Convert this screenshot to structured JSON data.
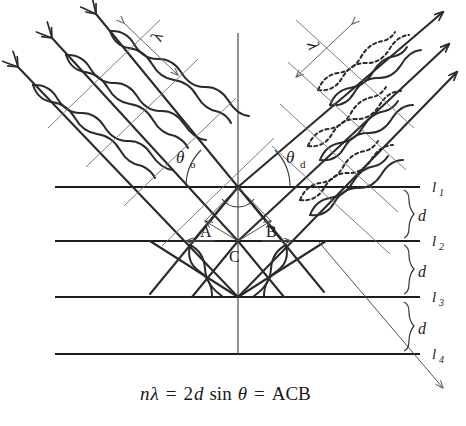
{
  "figure": {
    "equation": {
      "n": "n",
      "lambda": "λ",
      "eq1": "=",
      "two": "2",
      "d": "d",
      "sin": "sin",
      "theta": "θ",
      "eq2": "=",
      "acb": "ACB",
      "full": "nλ = 2d sin θ = ACB"
    },
    "angles": [
      {
        "name": "incident-angle",
        "symbol": "θ",
        "subscript": "o",
        "full": "θo",
        "side": "left"
      },
      {
        "name": "diffracted-angle",
        "symbol": "θ",
        "subscript": "d",
        "full": "θd",
        "side": "right"
      }
    ],
    "wavelength_labels": [
      {
        "name": "incident-wavelength",
        "symbol": "λ",
        "side": "left"
      },
      {
        "name": "diffracted-wavelength",
        "symbol": "λ",
        "side": "right"
      }
    ],
    "lattice_lines": [
      {
        "symbol": "l",
        "subscript": "1",
        "full": "l₁",
        "y": 187
      },
      {
        "symbol": "l",
        "subscript": "2",
        "full": "l₂",
        "y": 241
      },
      {
        "symbol": "l",
        "subscript": "3",
        "full": "l₃",
        "y": 297
      },
      {
        "symbol": "l",
        "subscript": "4",
        "full": "l₄",
        "y": 354
      }
    ],
    "spacings": [
      {
        "label": "d",
        "between": "l1-l2"
      },
      {
        "label": "d",
        "between": "l2-l3"
      },
      {
        "label": "d",
        "between": "l3-l4"
      }
    ],
    "points": [
      {
        "label": "A",
        "x": 207,
        "y": 226
      },
      {
        "label": "B",
        "x": 272,
        "y": 226
      },
      {
        "label": "C",
        "x": 238,
        "y": 242
      }
    ],
    "colors": {
      "ink": "#1a1a1a",
      "ray": "#2b2b2b",
      "thin": "#6e6e6e",
      "background": "#ffffff"
    }
  }
}
